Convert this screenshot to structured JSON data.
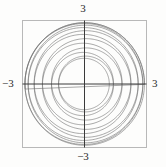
{
  "figure": {
    "name": "parametric-curve-plot",
    "background_color": "#fdfdfc"
  },
  "axis_labels": {
    "top": "3",
    "bottom": "−3",
    "left": "−3",
    "right": "3"
  },
  "chart_data": {
    "type": "line",
    "title": "",
    "subtitle": "",
    "xlabel": "",
    "ylabel": "",
    "xlim": [
      -3,
      3
    ],
    "ylim": [
      -3,
      3
    ],
    "xticks": [
      -3,
      3
    ],
    "yticks": [
      -3,
      3
    ],
    "xticklabels": [
      "−3",
      "3"
    ],
    "yticklabels": [
      "−3",
      "3"
    ],
    "grid": false,
    "legend": null,
    "frame": {
      "visible": true,
      "color": "#b8b8b8",
      "line_width": 1,
      "style": "square-box"
    },
    "axes_lines": {
      "visible": true,
      "color": "#3a3a3a",
      "line_width": 1,
      "x_axis_y": 0,
      "y_axis_x": 0
    },
    "curve": {
      "name": "spirograph-rose",
      "color": "#6e6e6e",
      "line_width": 0.6,
      "parametric": true,
      "t_start": 0,
      "t_end": 78.5398,
      "samples": 3000,
      "equations": {
        "x": "2.05*cos(t) + 0.85*cos(13*t/12)",
        "y": "2.05*sin(t) + 0.85*sin(13*t/12)"
      },
      "params": {
        "R": 2.05,
        "r": 0.85,
        "freq_ratio_num": 13,
        "freq_ratio_den": 12,
        "petals": 12,
        "turns": 12.5
      },
      "max_radius": 2.9,
      "min_radius": 1.2
    }
  }
}
